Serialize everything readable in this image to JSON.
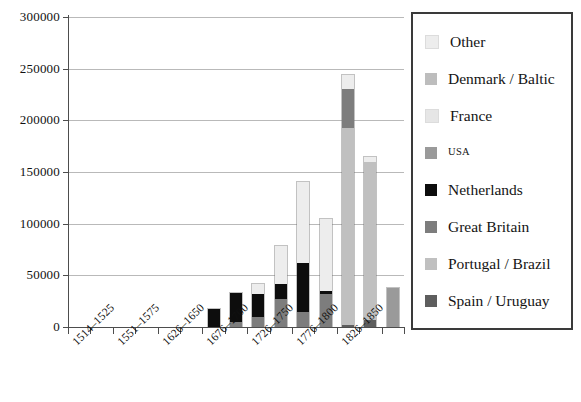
{
  "chart_data": {
    "type": "bar",
    "stacked": true,
    "title": "",
    "xlabel": "",
    "ylabel": "",
    "ylim": [
      0,
      300000
    ],
    "ytick_labels": [
      "0",
      "50000",
      "100000",
      "150000",
      "200000",
      "250000",
      "300000"
    ],
    "ytick_values": [
      0,
      50000,
      100000,
      150000,
      200000,
      250000,
      300000
    ],
    "grid": true,
    "legend_position": "right",
    "categories": [
      "1514–1525",
      "1526–1550",
      "1551–1575",
      "1576–1600",
      "1601–1625",
      "1626–1650",
      "1651–1675",
      "1676–1700",
      "1701–1725",
      "1726–1750",
      "1751–1775",
      "1776–1800",
      "1801–1825",
      "1826–1850",
      "1851–1875"
    ],
    "visible_tick_labels": [
      "1514–1525",
      "1551–1575",
      "1626–1650",
      "1676–1700",
      "1726–1750",
      "1776–1800",
      "1826–1850"
    ],
    "series": [
      {
        "name": "Spain / Uruguay",
        "color": "#5e5e5e",
        "values": [
          0,
          0,
          0,
          0,
          0,
          0,
          0,
          0,
          0,
          0,
          0,
          0,
          2000,
          7000,
          0
        ]
      },
      {
        "name": "Portugal / Brazil",
        "color": "#c0c0c0",
        "values": [
          0,
          0,
          0,
          0,
          0,
          0,
          0,
          0,
          0,
          0,
          0,
          0,
          191000,
          153000,
          0
        ]
      },
      {
        "name": "Great Britain",
        "color": "#7d7d7d",
        "values": [
          0,
          0,
          0,
          0,
          0,
          0,
          0,
          5000,
          10000,
          27000,
          15000,
          32000,
          37000,
          0,
          0
        ]
      },
      {
        "name": "Netherlands",
        "color": "#0d0d0d",
        "values": [
          0,
          0,
          0,
          0,
          0,
          0,
          17000,
          28000,
          22000,
          15000,
          47000,
          3000,
          0,
          0,
          0
        ]
      },
      {
        "name": "USA",
        "color": "#9a9a9a",
        "values": [
          0,
          0,
          0,
          0,
          0,
          0,
          0,
          0,
          0,
          0,
          0,
          0,
          0,
          0,
          38000
        ]
      },
      {
        "name": "France",
        "color": "#e6e6e6",
        "values": [
          0,
          0,
          0,
          0,
          0,
          0,
          0,
          0,
          0,
          0,
          0,
          0,
          0,
          0,
          0
        ]
      },
      {
        "name": "Denmark / Baltic",
        "color": "#bdbdbd",
        "values": [
          0,
          0,
          0,
          0,
          0,
          0,
          0,
          0,
          0,
          0,
          0,
          0,
          0,
          0,
          0
        ]
      },
      {
        "name": "Other",
        "color": "#ededed",
        "values": [
          0,
          0,
          0,
          0,
          0,
          0,
          0,
          0,
          10000,
          36000,
          78000,
          70000,
          14000,
          5000,
          0
        ]
      }
    ],
    "totals": [
      0,
      0,
      0,
      0,
      0,
      0,
      17000,
      33000,
      42000,
      78000,
      140000,
      105000,
      244000,
      165000,
      38000
    ]
  },
  "legend": {
    "items": [
      {
        "label": "Other",
        "color": "#ededed",
        "style": "normal"
      },
      {
        "label": "Denmark / Baltic",
        "color": "#bdbdbd",
        "style": "normal"
      },
      {
        "label": "France",
        "color": "#e6e6e6",
        "style": "normal"
      },
      {
        "label": "USA",
        "color": "#9a9a9a",
        "style": "small"
      },
      {
        "label": "Netherlands",
        "color": "#0d0d0d",
        "style": "normal"
      },
      {
        "label": "Great Britain",
        "color": "#7d7d7d",
        "style": "normal"
      },
      {
        "label": "Portugal / Brazil",
        "color": "#c0c0c0",
        "style": "normal"
      },
      {
        "label": "Spain / Uruguay",
        "color": "#5e5e5e",
        "style": "normal"
      }
    ]
  }
}
